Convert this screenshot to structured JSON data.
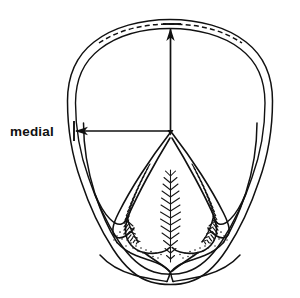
{
  "figure": {
    "background_color": "#ffffff",
    "ink_color": "#111111"
  },
  "labels": {
    "medial": {
      "text": "medial",
      "x": 10,
      "y": 135
    }
  },
  "annotations": {
    "horizontal_measure": {
      "name": "medial width measure",
      "from_x": 170,
      "from_y": 131,
      "to_x": 76,
      "to_y": 131,
      "arrow_direction": "left",
      "tick_x": 74,
      "tick_y1": 121,
      "tick_y2": 141
    },
    "vertical_measure": {
      "name": "toe length measure",
      "from_x": 170,
      "from_y": 131,
      "to_x": 170,
      "to_y": 34,
      "arrow_direction": "up",
      "tick_y": 24,
      "tick_x1": 163,
      "tick_x2": 181
    },
    "origin_point": {
      "name": "frog apex reference point",
      "x": 170,
      "y": 131
    }
  },
  "structures": [
    {
      "id": "outer-wall",
      "label": "hoof wall outer border"
    },
    {
      "id": "inner-wall",
      "label": "hoof wall inner border / white line"
    },
    {
      "id": "coronet-dashed",
      "label": "dashed toe reference arc"
    },
    {
      "id": "sole",
      "label": "sole"
    },
    {
      "id": "frog",
      "label": "frog"
    },
    {
      "id": "central-sulcus",
      "label": "central sulcus of frog"
    },
    {
      "id": "collateral-groove-left",
      "label": "left collateral groove"
    },
    {
      "id": "collateral-groove-right",
      "label": "right collateral groove"
    },
    {
      "id": "bar-left",
      "label": "left bar"
    },
    {
      "id": "bar-right",
      "label": "right bar"
    },
    {
      "id": "heel-bulb-left",
      "label": "left heel bulb"
    },
    {
      "id": "heel-bulb-right",
      "label": "right heel bulb"
    }
  ]
}
